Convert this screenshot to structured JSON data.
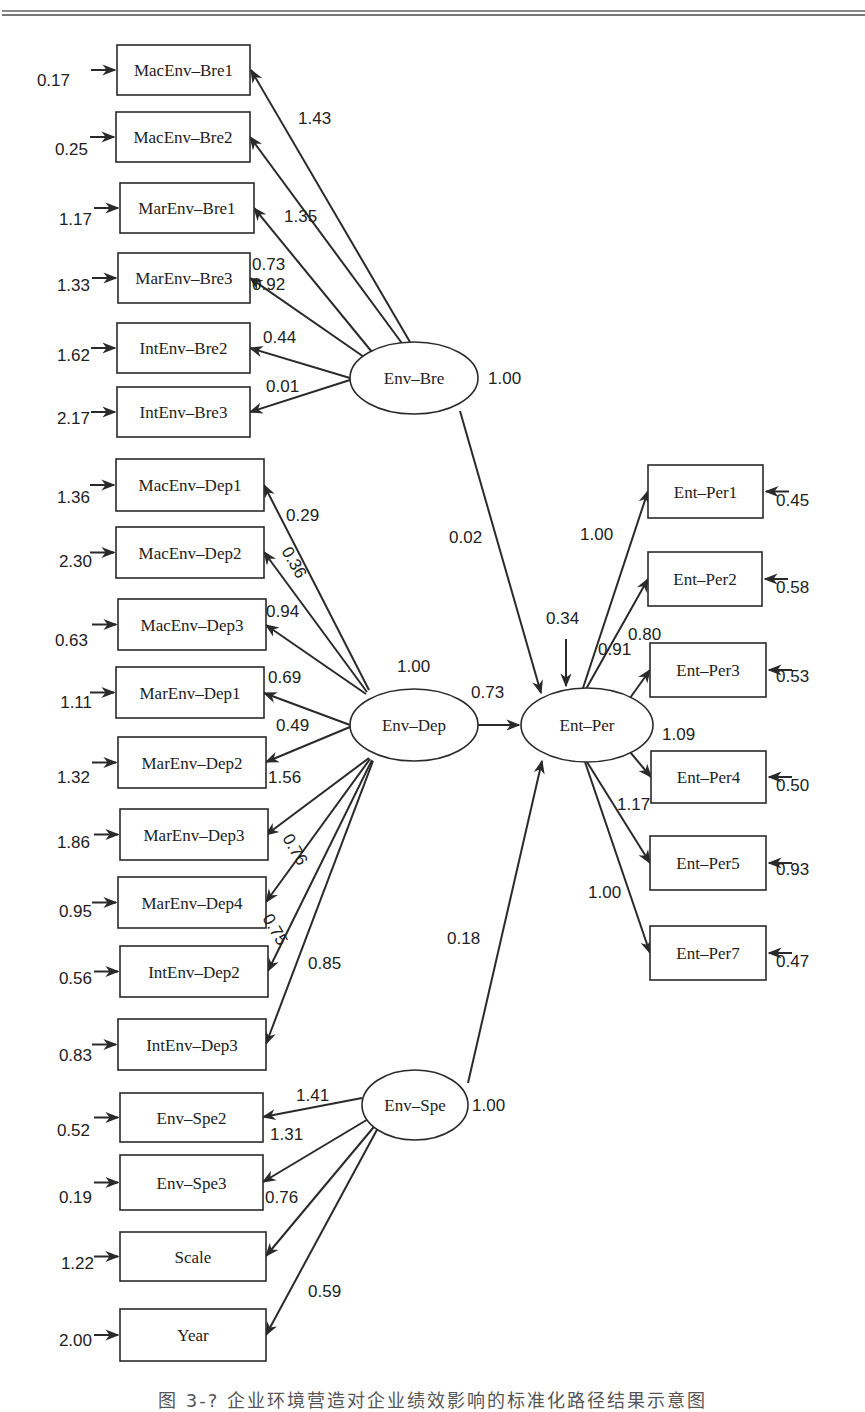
{
  "figure": {
    "caption": "图 3-? 企业环境营造对企业绩效影响的标准化路径结果示意图"
  },
  "chart_data": {
    "type": "diagram",
    "latent_variables": [
      {
        "id": "Env-Bre",
        "label": "Env–Bre",
        "variance": "1.00"
      },
      {
        "id": "Env-Dep",
        "label": "Env–Dep",
        "variance": "1.00"
      },
      {
        "id": "Env-Spe",
        "label": "Env–Spe",
        "variance": "1.00"
      },
      {
        "id": "Ent-Per",
        "label": "Ent–Per",
        "disturbance": "0.34"
      }
    ],
    "structural_paths": [
      {
        "from": "Env-Bre",
        "to": "Ent-Per",
        "coef": "0.02"
      },
      {
        "from": "Env-Dep",
        "to": "Ent-Per",
        "coef": "0.73"
      },
      {
        "from": "Env-Spe",
        "to": "Ent-Per",
        "coef": "0.18"
      }
    ],
    "indicators": {
      "Env-Bre": [
        {
          "label": "MacEnv–Bre1",
          "loading": "1.43",
          "error": "0.17"
        },
        {
          "label": "MacEnv–Bre2",
          "loading": "1.35",
          "error": "0.25"
        },
        {
          "label": "MarEnv–Bre1",
          "loading": "0.92",
          "error": "1.17"
        },
        {
          "label": "MarEnv–Bre3",
          "loading": "0.73",
          "error": "1.33"
        },
        {
          "label": "IntEnv–Bre2",
          "loading": "0.44",
          "error": "1.62"
        },
        {
          "label": "IntEnv–Bre3",
          "loading": "0.01",
          "error": "2.17"
        }
      ],
      "Env-Dep": [
        {
          "label": "MacEnv–Dep1",
          "loading": "0.29",
          "error": "1.36"
        },
        {
          "label": "MacEnv–Dep2",
          "loading": "0.36",
          "error": "2.30"
        },
        {
          "label": "MacEnv–Dep3",
          "loading": "0.94",
          "error": "0.63"
        },
        {
          "label": "MarEnv–Dep1",
          "loading": "0.69",
          "error": "1.11"
        },
        {
          "label": "MarEnv–Dep2",
          "loading": "0.49",
          "error": "1.32"
        },
        {
          "label": "MarEnv–Dep3",
          "loading": "1.56",
          "error": "1.86"
        },
        {
          "label": "MarEnv–Dep4",
          "loading": "0.76",
          "error": "0.95"
        },
        {
          "label": "IntEnv–Dep2",
          "loading": "0.75",
          "error": "0.56"
        },
        {
          "label": "IntEnv–Dep3",
          "loading": "0.85",
          "error": "0.83"
        }
      ],
      "Env-Spe": [
        {
          "label": "Env–Spe2",
          "loading": "1.41",
          "error": "0.52"
        },
        {
          "label": "Env–Spe3",
          "loading": "1.31",
          "error": "0.19"
        },
        {
          "label": "Scale",
          "loading": "0.76",
          "error": "1.22"
        },
        {
          "label": "Year",
          "loading": "0.59",
          "error": "2.00"
        }
      ],
      "Ent-Per": [
        {
          "label": "Ent–Per1",
          "loading": "1.00",
          "error": "0.45"
        },
        {
          "label": "Ent–Per2",
          "loading": "0.80",
          "error": "0.58"
        },
        {
          "label": "Ent–Per3",
          "loading": "0.91",
          "error": "0.53"
        },
        {
          "label": "Ent–Per4",
          "loading": "1.09",
          "error": "0.50"
        },
        {
          "label": "Ent–Per5",
          "loading": "1.17",
          "error": "0.93"
        },
        {
          "label": "Ent–Per7",
          "loading": "1.00",
          "error": "0.47"
        }
      ]
    }
  }
}
